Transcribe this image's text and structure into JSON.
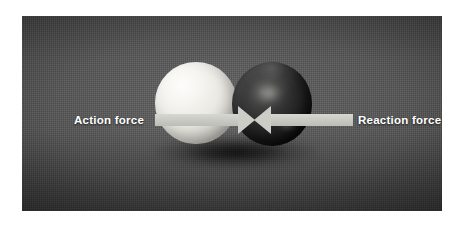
{
  "figure": {
    "page_background": "#ffffff",
    "photo": {
      "backdrop_color": "#4f4f4f",
      "backdrop_description": "dark gray woven fabric backdrop"
    },
    "objects": [
      {
        "name": "white-ball",
        "label": "white ball",
        "color": "#f2f1ec",
        "position": "left"
      },
      {
        "name": "dark-ball",
        "label": "dark ball",
        "color": "#1c1c1c",
        "position": "right"
      }
    ],
    "arrows": [
      {
        "name": "action-force-arrow",
        "label": "Action force",
        "direction": "right",
        "color": "#cdcdc8"
      },
      {
        "name": "reaction-force-arrow",
        "label": "Reaction force",
        "direction": "left",
        "color": "#cdcdc8"
      }
    ],
    "labels": {
      "action": "Action force",
      "reaction": "Reaction force",
      "text_color": "#ffffff"
    }
  }
}
